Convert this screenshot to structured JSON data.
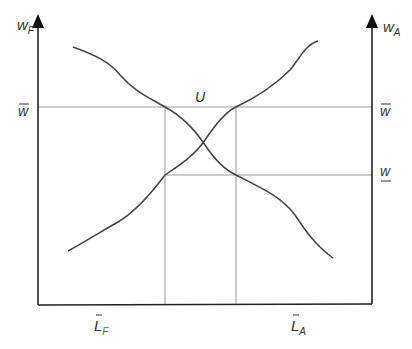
{
  "diagram": {
    "type": "specific-factors labor allocation",
    "left_axis": {
      "label": "w",
      "subscript": "F"
    },
    "right_axis": {
      "label": "w",
      "subscript": "A"
    },
    "left_wage_label": "w",
    "right_wage_high_label": "w",
    "right_wage_low_label": "w",
    "intersection_label": "U",
    "bottom_left_label": "L",
    "bottom_left_subscript": "F",
    "bottom_right_label": "L",
    "bottom_right_subscript": "A",
    "colors": {
      "axis": "#222222",
      "curve": "#444444",
      "guide": "#9a9a9a",
      "text": "#333333",
      "subscript_f": "#4a7a3a"
    }
  }
}
